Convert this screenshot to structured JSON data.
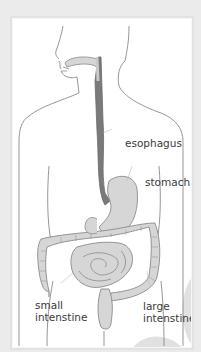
{
  "diagram": {
    "labels": {
      "esophagus": "esophagus",
      "stomach": "stomach",
      "small_intestine_line1": "small",
      "small_intestine_line2": "intenstine",
      "large_intestine_line1": "large",
      "large_intestine_line2": "intenstine"
    },
    "colors": {
      "background": "#ebebeb",
      "panel": "#ffffff",
      "outline": "#8a8a8a",
      "organ_fill": "#d6d6d6",
      "esophagus_fill": "#7a7a7a",
      "label_text": "#3a3a3a",
      "decoration": "#d9d9d9"
    }
  }
}
